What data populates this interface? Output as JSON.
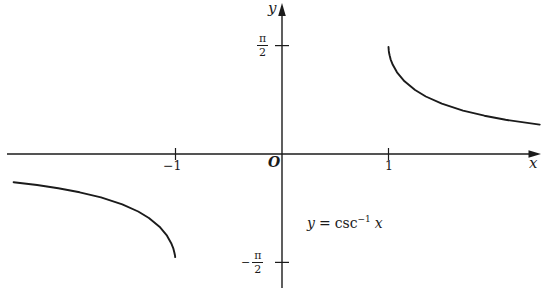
{
  "figure": {
    "background": "#ffffff",
    "ink_color": "#1b1b1b",
    "y_axis_label": "y",
    "x_axis_label": "x",
    "origin_label": "O",
    "pi_over_2": {
      "num": "π",
      "den": "2"
    },
    "neg_pi_over_2": {
      "sign": "−",
      "num": "π",
      "den": "2"
    },
    "equation": {
      "lhs_var": "y",
      "equals": "=",
      "func": "csc",
      "exponent": "−1",
      "rhs_var": "x"
    }
  },
  "chart_data": {
    "type": "line",
    "xlabel": "x",
    "ylabel": "y",
    "xlim": [
      -2.6,
      2.45
    ],
    "ylim": [
      -2.2,
      2.2
    ],
    "grid": false,
    "legend": false,
    "x_ticks": [
      {
        "value": -1,
        "label": "−1"
      },
      {
        "value": 1,
        "label": "1"
      }
    ],
    "y_ticks": [
      {
        "value": 1.5708,
        "label": "π/2"
      },
      {
        "value": -1.5708,
        "label": "−π/2"
      }
    ],
    "series": [
      {
        "name": "left branch (x ≤ −1)",
        "x": [
          -2.52,
          -2.3,
          -2.1,
          -1.9,
          -1.7,
          -1.5,
          -1.35,
          -1.25,
          -1.15,
          -1.08,
          -1.04,
          -1.02,
          -1.01,
          -1.005,
          -1.003
        ],
        "y": [
          -0.4081,
          -0.4498,
          -0.4963,
          -0.5548,
          -0.6289,
          -0.7297,
          -0.8339,
          -0.9273,
          -1.0541,
          -1.1835,
          -1.2927,
          -1.3726,
          -1.4301,
          -1.471,
          -1.4935
        ]
      },
      {
        "name": "right branch (x ≥ 1)",
        "x": [
          1.0002,
          1.003,
          1.005,
          1.01,
          1.02,
          1.04,
          1.08,
          1.15,
          1.25,
          1.35,
          1.5,
          1.7,
          1.9,
          2.1,
          2.42
        ],
        "y": [
          1.5508,
          1.4935,
          1.471,
          1.4301,
          1.3726,
          1.2927,
          1.1835,
          1.0541,
          0.9273,
          0.8339,
          0.7297,
          0.6289,
          0.5548,
          0.4963,
          0.4261
        ]
      }
    ]
  }
}
